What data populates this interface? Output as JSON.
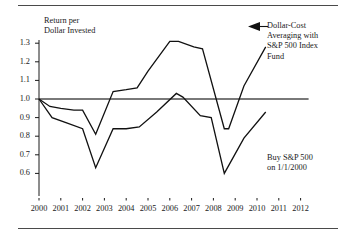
{
  "chart_data": {
    "type": "line",
    "title": "",
    "xlabel": "",
    "ylabel": "Return per Dollar Invested",
    "ylabel_line1": "Return per",
    "ylabel_line2": "Dollar Invested",
    "xlim": [
      2000,
      2012
    ],
    "ylim": [
      0.6,
      1.35
    ],
    "yticks": [
      "1.3",
      "1.2",
      "1.1",
      "1.0",
      "0.9",
      "0.8",
      "0.7",
      "0.6"
    ],
    "ytick_values": [
      1.3,
      1.2,
      1.1,
      1.0,
      0.9,
      0.8,
      0.7,
      0.6
    ],
    "xticks": [
      "2000",
      "2001",
      "2002",
      "2003",
      "2004",
      "2005",
      "2006",
      "2007",
      "2008",
      "2009",
      "2010",
      "2011",
      "2012"
    ],
    "xtick_values": [
      2000,
      2001,
      2002,
      2003,
      2004,
      2005,
      2006,
      2007,
      2008,
      2009,
      2010,
      2011,
      2012
    ],
    "grid": false,
    "legend_position": "annotations",
    "reference_line": {
      "y": 1.0,
      "label": "break-even"
    },
    "series": [
      {
        "name": "Dollar-Cost Averaging with S&P 500 Index Fund",
        "annotation_lines": [
          "Dollar-Cost",
          "Averaging with",
          "S&P 500 Index",
          "Fund"
        ],
        "x": [
          2000.0,
          2000.5,
          2001.0,
          2001.6,
          2002.0,
          2002.6,
          2003.4,
          2004.0,
          2004.5,
          2005.0,
          2006.0,
          2006.4,
          2007.1,
          2007.5,
          2008.5,
          2008.7,
          2009.4,
          2010.4
        ],
        "values": [
          1.0,
          0.96,
          0.95,
          0.94,
          0.94,
          0.81,
          1.04,
          1.05,
          1.06,
          1.15,
          1.31,
          1.31,
          1.28,
          1.27,
          0.84,
          0.84,
          1.07,
          1.28
        ]
      },
      {
        "name": "Buy S&P 500 on 1/1/2000",
        "annotation_lines": [
          "Buy S&P 500",
          "on 1/1/2000"
        ],
        "x": [
          2000.0,
          2000.6,
          2001.3,
          2002.0,
          2002.6,
          2003.4,
          2004.0,
          2004.6,
          2005.4,
          2006.3,
          2006.6,
          2007.4,
          2007.9,
          2008.5,
          2009.4,
          2010.4
        ],
        "values": [
          1.0,
          0.9,
          0.87,
          0.84,
          0.63,
          0.84,
          0.84,
          0.85,
          0.93,
          1.03,
          1.01,
          0.91,
          0.9,
          0.6,
          0.79,
          0.93
        ]
      }
    ],
    "annotations": [
      {
        "id": "dca-callout",
        "text": "Dollar-Cost Averaging with S&P 500 Index Fund",
        "arrow": "left",
        "points_to_series": "Dollar-Cost Averaging with S&P 500 Index Fund"
      },
      {
        "id": "lumpsum-callout",
        "text": "Buy S&P 500 on 1/1/2000",
        "arrow": "none",
        "points_to_series": "Buy S&P 500 on 1/1/2000"
      }
    ]
  }
}
